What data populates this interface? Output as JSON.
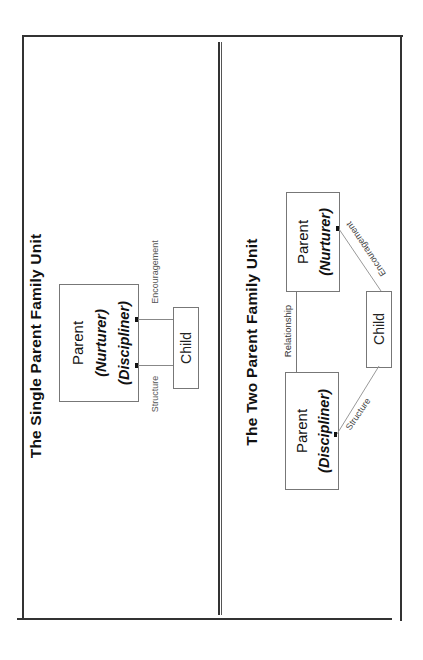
{
  "diagram": {
    "orientation": "rotated-90-ccw",
    "panels": [
      {
        "id": "single",
        "title": "The Single Parent Family Unit",
        "nodes": {
          "parent": {
            "label": "Parent",
            "roles": [
              "(Nurturer)",
              "(Discipliner)"
            ]
          },
          "child": {
            "label": "Child"
          }
        },
        "edges": [
          {
            "from": "child",
            "to": "parent",
            "label": "Encouragement"
          },
          {
            "from": "child",
            "to": "parent",
            "label": "Structure"
          }
        ]
      },
      {
        "id": "two",
        "title": "The Two Parent Family Unit",
        "nodes": {
          "nurturer": {
            "label": "Parent",
            "role": "(Nurturer)"
          },
          "discipliner": {
            "label": "Parent",
            "role": "(Discipliner)"
          },
          "child": {
            "label": "Child"
          }
        },
        "edges": [
          {
            "from": "nurturer",
            "to": "discipliner",
            "label": "Relationship"
          },
          {
            "from": "child",
            "to": "nurturer",
            "label": "Encouragement"
          },
          {
            "from": "child",
            "to": "discipliner",
            "label": "Structure"
          }
        ]
      }
    ]
  },
  "colors": {
    "border": "#333333",
    "box_border": "#777777",
    "connector": "#888888",
    "text": "#111111"
  }
}
